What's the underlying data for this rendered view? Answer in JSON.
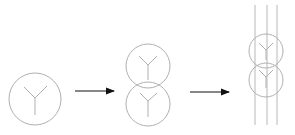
{
  "diagram": {
    "colors": {
      "symbol_stroke": "#b0b0b0",
      "arrow": "#111111",
      "background": "#ffffff"
    },
    "stages": [
      {
        "id": "single-winding",
        "circles": [
          {
            "cx": 35,
            "cy": 99,
            "r": 26,
            "y_symbol": true
          }
        ]
      },
      {
        "id": "two-winding",
        "circles": [
          {
            "cx": 148,
            "cy": 66,
            "r": 22,
            "y_symbol": true
          },
          {
            "cx": 148,
            "cy": 104,
            "r": 22,
            "y_symbol": true
          }
        ]
      },
      {
        "id": "two-winding-with-conductors",
        "circles": [
          {
            "cx": 266,
            "cy": 51,
            "r": 17,
            "y_symbol": true
          },
          {
            "cx": 266,
            "cy": 80,
            "r": 17,
            "y_symbol": true
          }
        ],
        "conductor_lines_x": [
          255,
          267,
          277
        ],
        "conductor_lines_y": [
          5,
          125
        ]
      }
    ],
    "arrows": [
      {
        "from_x": 75,
        "to_x": 115,
        "y": 91
      },
      {
        "from_x": 190,
        "to_x": 230,
        "y": 92
      }
    ]
  }
}
